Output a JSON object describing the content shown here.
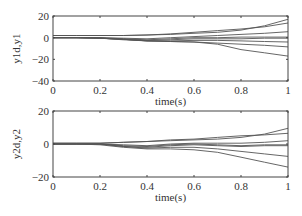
{
  "chart_data": [
    {
      "type": "line",
      "title": "",
      "xlabel": "time(s)",
      "ylabel": "y1d,y1",
      "xlim": [
        0,
        1
      ],
      "ylim": [
        -40,
        20
      ],
      "xticks": [
        0,
        0.2,
        0.4,
        0.6,
        0.8,
        1
      ],
      "xtick_labels": [
        "0",
        "0.2",
        "0.4",
        "0.6",
        "0.8",
        "1"
      ],
      "yticks": [
        -40,
        -20,
        0,
        20
      ],
      "ytick_labels": [
        "-40",
        "-20",
        "0",
        "20"
      ],
      "grid": false,
      "legend": null,
      "x": [
        0,
        0.1,
        0.2,
        0.3,
        0.4,
        0.5,
        0.6,
        0.7,
        0.8,
        0.9,
        1.0
      ],
      "series": [
        {
          "name": "curve1",
          "values": [
            2,
            2,
            2,
            2,
            2.5,
            3,
            4,
            5,
            7,
            11,
            17
          ]
        },
        {
          "name": "curve2",
          "values": [
            2,
            2,
            2,
            2,
            2.5,
            3.5,
            5,
            6.5,
            8,
            10,
            13.5
          ]
        },
        {
          "name": "curve3",
          "values": [
            0,
            0,
            0,
            -0.5,
            -1,
            0,
            1,
            2,
            3,
            4,
            5.5
          ]
        },
        {
          "name": "curve4",
          "values": [
            0,
            0,
            0,
            -1,
            -2,
            -1,
            0,
            0,
            0.5,
            0.5,
            0.5
          ]
        },
        {
          "name": "curve5",
          "values": [
            0,
            0,
            -0.5,
            -1.5,
            -2.5,
            -2,
            -1,
            -1,
            -1,
            -0.5,
            -0.5
          ]
        },
        {
          "name": "curve6",
          "values": [
            0,
            0,
            -0.5,
            -1.5,
            -3,
            -3,
            -2.5,
            -2.5,
            -3,
            -3.5,
            -4
          ]
        },
        {
          "name": "curve7",
          "values": [
            0,
            0,
            -0.5,
            -1.5,
            -3,
            -3.5,
            -4,
            -5,
            -6,
            -7,
            -8.5
          ]
        },
        {
          "name": "curve8",
          "values": [
            0,
            0,
            -0.5,
            -2,
            -3,
            -3.5,
            -4,
            -6,
            -11,
            -14,
            -17
          ]
        }
      ]
    },
    {
      "type": "line",
      "title": "",
      "xlabel": "time(s)",
      "ylabel": "y2d,y2",
      "xlim": [
        0,
        1
      ],
      "ylim": [
        -20,
        20
      ],
      "xticks": [
        0,
        0.2,
        0.4,
        0.6,
        0.8,
        1
      ],
      "xtick_labels": [
        "0",
        "0.2",
        "0.4",
        "0.6",
        "0.8",
        "1"
      ],
      "yticks": [
        -20,
        0,
        20
      ],
      "ytick_labels": [
        "-20",
        "0",
        "20"
      ],
      "grid": false,
      "legend": null,
      "x": [
        0,
        0.1,
        0.2,
        0.3,
        0.4,
        0.5,
        0.6,
        0.7,
        0.8,
        0.9,
        1.0
      ],
      "series": [
        {
          "name": "curve1",
          "values": [
            0.5,
            0.5,
            0.5,
            1,
            1.5,
            2,
            2.5,
            3,
            4,
            6,
            9.5
          ]
        },
        {
          "name": "curve2",
          "values": [
            0.5,
            0.5,
            0.5,
            1,
            1.5,
            2.5,
            3,
            4,
            5,
            5.5,
            6.5
          ]
        },
        {
          "name": "curve3",
          "values": [
            0,
            0,
            0,
            -0.5,
            -1,
            0,
            0.5,
            0.5,
            0.5,
            1,
            2
          ]
        },
        {
          "name": "curve4",
          "values": [
            0,
            0,
            0,
            -1,
            -1.5,
            -0.5,
            0,
            -0.5,
            -1,
            -0.5,
            -0.5
          ]
        },
        {
          "name": "curve5",
          "values": [
            0,
            0,
            0,
            -1.5,
            -2,
            -1,
            -0.5,
            -1,
            -1.5,
            -1,
            -1
          ]
        },
        {
          "name": "curve6",
          "values": [
            0,
            0,
            0,
            -1.5,
            -2.5,
            -2,
            -2,
            -3,
            -4.5,
            -6,
            -7.5
          ]
        },
        {
          "name": "curve7",
          "values": [
            0,
            0,
            -0.5,
            -2,
            -3,
            -3,
            -3.5,
            -5,
            -8,
            -11,
            -14
          ]
        }
      ]
    }
  ],
  "plots": [
    {
      "box": {
        "x": 53,
        "y": 16,
        "w": 235,
        "h": 65
      }
    },
    {
      "box": {
        "x": 53,
        "y": 111,
        "w": 235,
        "h": 66
      }
    }
  ],
  "colors": {
    "axes": "#444444",
    "line": "#555555",
    "text": "#333333"
  }
}
